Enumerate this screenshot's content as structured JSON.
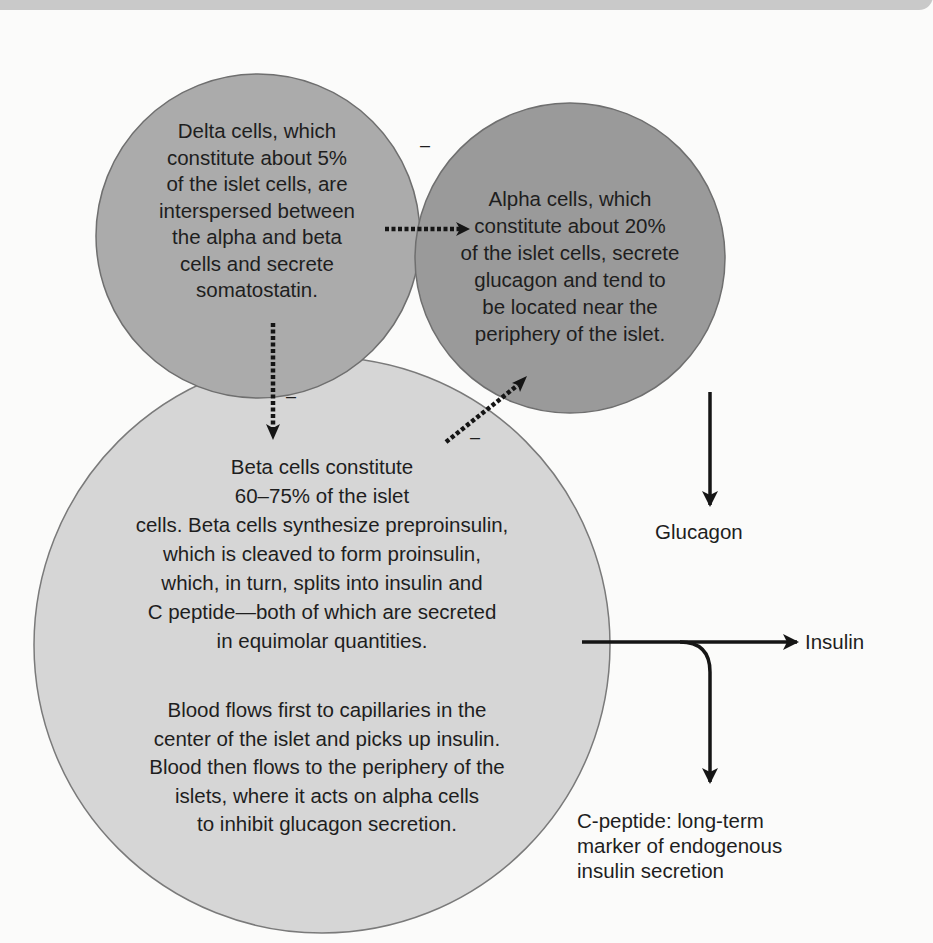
{
  "figure": {
    "type": "pancreatic islet cell diagram",
    "colors": {
      "background": "#fbfbfa",
      "top_bar": "#c9c9c9",
      "delta_fill": "#ababab",
      "alpha_fill": "#9a9a9a",
      "beta_fill": "#d6d6d6",
      "circle_stroke": "#6f6f6f",
      "arrow": "#151515"
    }
  },
  "cells": {
    "delta": {
      "lines": [
        "Delta cells, which",
        "constitute about 5%",
        "of the islet cells, are",
        "interspersed between",
        "the alpha and beta",
        "cells and secrete",
        "somatostatin."
      ]
    },
    "alpha": {
      "lines": [
        "Alpha cells, which",
        "constitute about 20%",
        "of the islet cells, secrete",
        "glucagon and tend to",
        "be located near the",
        "periphery of the islet."
      ]
    },
    "beta": {
      "lines": [
        "Beta cells constitute",
        "60–75% of the islet",
        "cells. Beta cells synthesize preproinsulin,",
        "which is cleaved to form proinsulin,",
        "which, in turn, splits into insulin and",
        "C peptide—both of which are secreted",
        "in equimolar quantities."
      ]
    },
    "blood_flow": {
      "lines": [
        "Blood flows first to capillaries in the",
        "center of the islet and picks up insulin.",
        "Blood then flows to the periphery of the",
        "islets, where it acts on alpha cells",
        "to inhibit glucagon secretion."
      ]
    }
  },
  "inhibition_signs": {
    "delta_to_alpha": "–",
    "delta_to_beta": "–",
    "beta_to_alpha": "–"
  },
  "outputs": {
    "glucagon": "Glucagon",
    "insulin": "Insulin",
    "c_peptide": {
      "lines": [
        "C-peptide: long-term",
        "marker of endogenous",
        "insulin secretion"
      ]
    }
  }
}
